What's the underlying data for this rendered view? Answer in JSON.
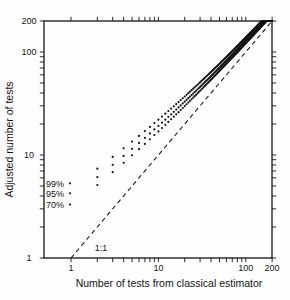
{
  "figure": {
    "background": "#fefefe",
    "ink": "#141414"
  },
  "chart_data": {
    "type": "scatter",
    "title": "",
    "xlabel": "Number of tests from classical estimator",
    "ylabel": "Adjusted number of tests",
    "x_scale": "log",
    "y_scale": "log",
    "xlim": [
      0.5,
      200
    ],
    "ylim": [
      1,
      200
    ],
    "x_tick_labels": [
      "1",
      "10",
      "100",
      "200"
    ],
    "y_tick_labels": [
      "1",
      "10",
      "100",
      "200"
    ],
    "major_ticks": [
      1,
      10,
      100,
      200
    ],
    "minor_ticks": [
      2,
      3,
      4,
      5,
      6,
      7,
      8,
      9,
      20,
      30,
      40,
      50,
      60,
      70,
      80,
      90
    ],
    "grid": "off",
    "marker": "dot",
    "reference_line": {
      "label": "1:1",
      "style": "dashed",
      "from": [
        1,
        1
      ],
      "to": [
        200,
        200
      ]
    },
    "series_model": "y = x + c*sqrt(x) for integer x from 2 to 200, clipped at y = 200",
    "series": [
      {
        "name": "99%",
        "c": 3.8,
        "sample_points": [
          [
            2,
            7.4
          ],
          [
            3,
            9.6
          ],
          [
            5,
            13.5
          ],
          [
            10,
            22.0
          ],
          [
            20,
            37.0
          ],
          [
            50,
            76.9
          ],
          [
            100,
            138.0
          ],
          [
            153,
            200.0
          ]
        ]
      },
      {
        "name": "95%",
        "c": 2.9,
        "sample_points": [
          [
            2,
            6.1
          ],
          [
            3,
            8.0
          ],
          [
            5,
            11.5
          ],
          [
            10,
            19.2
          ],
          [
            20,
            33.0
          ],
          [
            50,
            70.5
          ],
          [
            100,
            129.0
          ],
          [
            163,
            200.0
          ]
        ]
      },
      {
        "name": "70%",
        "c": 2.2,
        "sample_points": [
          [
            2,
            5.1
          ],
          [
            3,
            6.8
          ],
          [
            5,
            9.9
          ],
          [
            10,
            17.0
          ],
          [
            20,
            29.8
          ],
          [
            50,
            65.6
          ],
          [
            100,
            122.0
          ],
          [
            171,
            199.8
          ]
        ]
      }
    ],
    "legend": {
      "position": "inside-left",
      "entries": [
        "99%",
        "95%",
        "70%"
      ]
    }
  }
}
